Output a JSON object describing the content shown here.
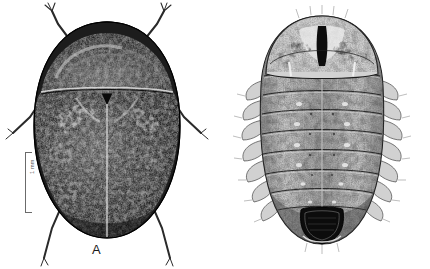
{
  "figure": {
    "background_color": "#ffffff",
    "ink_color": "#1a1a1a",
    "scalebar_color": "#6b6b6b",
    "panels": [
      {
        "id": "A",
        "label": "A",
        "subject": "adult-beetle-dorsal",
        "description": "Dorsal habitus of adult beetle, dense stipple shading, oval convex body with head, pronotum and elytra divided by a pale median elytral suture; three pairs of legs and antennae visible.",
        "scalebar": {
          "label": "1 mm",
          "orientation": "vertical",
          "length_px": 61
        }
      },
      {
        "id": "B",
        "label": "B",
        "subject": "larva-dorsal",
        "description": "Dorsal habitus of larva, broad oval outline with large semicircular head capsule bearing a dark median stripe, followed by segmented thorax and abdomen with lateral fringed lobes and a dark pigmented terminal segment.",
        "scalebar": {
          "label": "2 mm",
          "orientation": "horizontal",
          "length_px": 48
        }
      }
    ]
  }
}
